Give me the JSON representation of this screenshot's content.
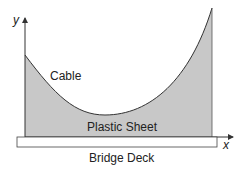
{
  "diagram": {
    "labels": {
      "cable": "Cable",
      "sheet": "Plastic Sheet",
      "deck": "Bridge Deck",
      "x_axis": "x",
      "y_axis": "y"
    },
    "colors": {
      "fill": "#c8c8c8",
      "stroke": "#333333"
    }
  }
}
